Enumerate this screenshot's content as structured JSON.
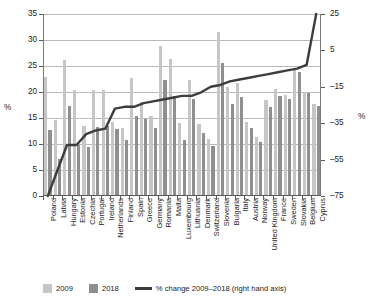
{
  "chart_data": {
    "type": "bar",
    "title": "",
    "xlabel": "",
    "ylabel": "%",
    "ylabel_right": "%",
    "ylim": [
      0,
      35
    ],
    "yticks": [
      "0",
      "5",
      "10",
      "15",
      "20",
      "25",
      "30",
      "35"
    ],
    "ylim_right": [
      -75,
      25
    ],
    "yticks_right": [
      "-75",
      "-55",
      "-35",
      "-15",
      "5",
      "25"
    ],
    "grid": true,
    "legend_position": "bottom",
    "categories": [
      "Poland",
      "Latvia",
      "Hungary",
      "Estonia",
      "Czechia",
      "Portugal",
      "Ireland",
      "Netherlands",
      "Finland",
      "Spain",
      "Greece",
      "Germany",
      "Romania",
      "Malta",
      "Luxembourg",
      "Lithuania",
      "Denmark",
      "Switzerland",
      "Slovenia",
      "Bulgaria",
      "Italy",
      "Austria",
      "Norway",
      "United Kingdom",
      "France",
      "Sweden",
      "Slovakia",
      "Belgium",
      "Cyprus"
    ],
    "series": [
      {
        "name": "2009",
        "color": "#c6c6c6",
        "values": [
          22.8,
          14.7,
          26.1,
          20.4,
          13.4,
          20.4,
          20.4,
          14.3,
          13.0,
          22.7,
          18.1,
          15.4,
          28.8,
          26.4,
          14.0,
          22.4,
          13.9,
          11.0,
          31.6,
          20.9,
          21.8,
          14.3,
          11.4,
          18.4,
          20.5,
          19.4,
          24.3,
          20.0,
          17.6
        ]
      },
      {
        "name": "2018",
        "color": "#8f8f8f",
        "values": [
          12.7,
          7.1,
          17.4,
          9.9,
          9.5,
          13.2,
          13.4,
          12.8,
          10.7,
          15.3,
          14.8,
          13.0,
          22.3,
          19.2,
          10.8,
          18.6,
          12.1,
          9.6,
          25.6,
          17.6,
          19.1,
          13.0,
          10.4,
          17.1,
          19.3,
          18.6,
          23.8,
          19.8,
          17.4
        ]
      }
    ],
    "line_series": {
      "name": "% change 2009–2018 (right hand axis)",
      "color": "#3d3d3d",
      "axis": "right",
      "values": [
        -75,
        -61,
        -47,
        -47,
        -41,
        -39,
        -38,
        -27,
        -26,
        -26,
        -24,
        -23,
        -22,
        -21,
        -20,
        -20,
        -18,
        -15,
        -14,
        -12,
        -11,
        -10,
        -9,
        -8,
        -7,
        -6,
        -5,
        -3,
        25
      ]
    },
    "legend": [
      {
        "label": "2009",
        "marker": "square",
        "color": "#c6c6c6"
      },
      {
        "label": "2018",
        "marker": "square",
        "color": "#8f8f8f"
      },
      {
        "label": "% change 2009–2018 (right hand axis)",
        "marker": "line",
        "color": "#3d3d3d"
      }
    ]
  }
}
